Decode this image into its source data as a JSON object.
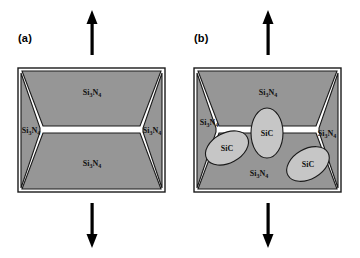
{
  "figure": {
    "type": "materials-microstructure-schematic",
    "colors": {
      "matrix_gray": "#969696",
      "inclusion_gray": "#c6c6c6",
      "grain_boundary": "#ffffff",
      "outline": "#1a1a1a",
      "arrow": "#000000",
      "background": "#ffffff"
    }
  },
  "panels": [
    {
      "id": "a",
      "label": "(a)",
      "arrow_up": "up-arrow",
      "arrow_down": "down-arrow",
      "grains": [
        {
          "name": "grain-top",
          "formula_pre": "Si",
          "sub1": "3",
          "formula_mid": "N",
          "sub2": "4"
        },
        {
          "name": "grain-left",
          "formula_pre": "Si",
          "sub1": "3",
          "formula_mid": "N",
          "sub2": "4"
        },
        {
          "name": "grain-right",
          "formula_pre": "Si",
          "sub1": "3",
          "formula_mid": "N",
          "sub2": "4"
        },
        {
          "name": "grain-bottom",
          "formula_pre": "Si",
          "sub1": "3",
          "formula_mid": "N",
          "sub2": "4"
        }
      ],
      "inclusions": []
    },
    {
      "id": "b",
      "label": "(b)",
      "arrow_up": "up-arrow",
      "arrow_down": "down-arrow",
      "grains": [
        {
          "name": "grain-top",
          "formula_pre": "Si",
          "sub1": "3",
          "formula_mid": "N",
          "sub2": "4"
        },
        {
          "name": "grain-left",
          "formula_pre": "Si",
          "sub1": "3",
          "formula_mid": "N",
          "sub2": "4"
        },
        {
          "name": "grain-right",
          "formula_pre": "Si",
          "sub1": "3",
          "formula_mid": "N",
          "sub2": "4"
        },
        {
          "name": "grain-bottom",
          "formula_pre": "Si",
          "sub1": "3",
          "formula_mid": "N",
          "sub2": "4"
        }
      ],
      "inclusions": [
        {
          "name": "sic-left",
          "label": "SiC"
        },
        {
          "name": "sic-center",
          "label": "SiC"
        },
        {
          "name": "sic-right",
          "label": "SiC"
        }
      ]
    }
  ]
}
